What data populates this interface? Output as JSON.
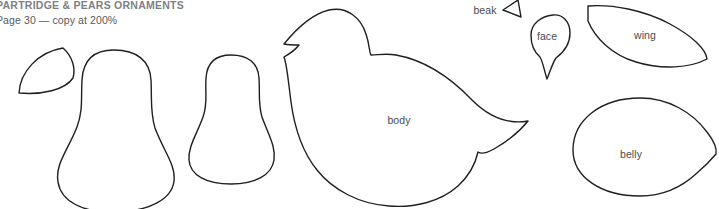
{
  "header": {
    "title": "PARTRIDGE & PEARS ORNAMENTS",
    "subtitle": "Page 30 — copy at 200%"
  },
  "colors": {
    "background": "#ffffff",
    "outline": "#1f1f20",
    "label_text": "#4a4a4d",
    "title_text": "#7d7f84",
    "subtitle_text": "#58585b"
  },
  "pattern": {
    "stroke_width": "1.4",
    "pieces": [
      {
        "id": "leaf",
        "name": "leaf",
        "label": "",
        "label_x": 48,
        "label_y": 72,
        "path": "M 19 93 C 20 72 38 52 63 48 C 72 56 76 68 73 78 C 65 90 42 95 19 93 Z"
      },
      {
        "id": "pear-large",
        "name": "pear-large",
        "label": "",
        "label_x": 116,
        "label_y": 140,
        "path": "M 114 50 C 137 50 150 61 151 80 C 152 100 150 112 155 128 C 164 152 176 165 174 181 C 172 199 150 211 116 212 C 82 213 61 201 58 182 C 55 164 68 150 77 127 C 83 111 81 99 82 80 C 83 61 93 50 114 50 Z"
      },
      {
        "id": "pear-small",
        "name": "pear-small",
        "label": "",
        "label_x": 231,
        "label_y": 128,
        "path": "M 231 55 C 248 55 258 63 259 78 C 260 94 258 104 262 117 C 269 136 276 147 274 160 C 272 175 255 184 231 184 C 206 184 190 175 189 160 C 188 147 196 136 203 117 C 208 104 205 94 206 78 C 207 63 215 55 231 55 Z"
      },
      {
        "id": "body",
        "name": "body",
        "label": "body",
        "label_x": 399,
        "label_y": 120,
        "path": "M 284 44 C 297 28 312 14 329 10 C 347 6 361 18 366 34 C 370 46 369 52 371 55 C 378 55 386 53 396 55 C 424 60 450 77 472 100 C 491 119 511 124 528 121 C 520 131 508 141 494 149 C 485 154 481 154 478 152 C 476 161 470 175 458 186 C 440 202 414 208 389 206 C 359 204 333 190 317 170 C 300 149 294 124 291 102 C 288 79 287 65 284 57 C 291 53 296 49 299 45 C 294 45 289 45 284 44 Z"
      },
      {
        "id": "beak",
        "name": "beak",
        "label": "beak",
        "label_x": 485,
        "label_y": 10,
        "path": "M 518 0 L 503 10 L 521 17 Z"
      },
      {
        "id": "face",
        "name": "face",
        "label": "face",
        "label_x": 547,
        "label_y": 36,
        "path": "M 553 15 C 563 14 570 22 570 33 C 570 44 564 52 556 58 C 552 64 550 72 547 79 C 544 70 543 62 540 57 C 534 52 531 44 531 35 C 531 24 541 16 553 15 Z"
      },
      {
        "id": "wing",
        "name": "wing",
        "label": "wing",
        "label_x": 645,
        "label_y": 35,
        "path": "M 588 6 C 612 4 644 10 670 24 C 692 36 706 49 707 59 C 690 68 662 70 636 62 C 612 55 595 38 588 21 Z"
      },
      {
        "id": "belly",
        "name": "belly",
        "label": "belly",
        "label_x": 631,
        "label_y": 154,
        "path": "M 640 98 C 668 98 692 112 707 132 C 714 141 717 149 716 154 C 711 160 704 167 697 173 C 682 187 663 196 640 196 C 601 196 573 177 573 150 C 573 120 601 98 640 98 Z"
      }
    ]
  }
}
